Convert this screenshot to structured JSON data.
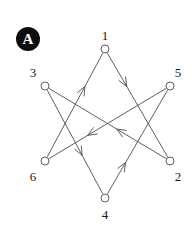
{
  "figure": {
    "panel_label": "A",
    "background_color": "#ffffff",
    "stroke_color": "#4d4d4d",
    "badge_color": "#0d0d0d",
    "badge_text_color": "#ffffff",
    "width": 192,
    "height": 226
  },
  "diagram_data": {
    "type": "directed-graph",
    "layout": "hexagram",
    "nodes": [
      {
        "id": "1",
        "label": "1",
        "cx": 105,
        "cy": 49,
        "r": 4,
        "label_x": 105,
        "label_y": 29
      },
      {
        "id": "3",
        "label": "3",
        "cx": 45,
        "cy": 86,
        "r": 4,
        "label_x": 33,
        "label_y": 66
      },
      {
        "id": "5",
        "label": "5",
        "cx": 170,
        "cy": 86,
        "r": 4,
        "label_x": 178,
        "label_y": 66
      },
      {
        "id": "6",
        "label": "6",
        "cx": 45,
        "cy": 161,
        "r": 4,
        "label_x": 33,
        "label_y": 170
      },
      {
        "id": "2",
        "label": "2",
        "cx": 170,
        "cy": 161,
        "r": 4,
        "label_x": 178,
        "label_y": 170
      },
      {
        "id": "4",
        "label": "4",
        "cx": 105,
        "cy": 198,
        "r": 4,
        "label_x": 105,
        "label_y": 208
      }
    ],
    "edges": [
      {
        "from": "1",
        "to": "2",
        "arrow_at": 0.32,
        "arrow_dir": "down-right"
      },
      {
        "from": "2",
        "to": "3",
        "arrow_at": 0.42,
        "arrow_dir": "left"
      },
      {
        "from": "3",
        "to": "4",
        "arrow_at": 0.63,
        "arrow_dir": "down"
      },
      {
        "from": "4",
        "to": "5",
        "arrow_at": 0.3,
        "arrow_dir": "up-right"
      },
      {
        "from": "5",
        "to": "6",
        "arrow_at": 0.67,
        "arrow_dir": "down-left"
      },
      {
        "from": "6",
        "to": "1",
        "arrow_at": 0.68,
        "arrow_dir": "up-right"
      }
    ],
    "edge_list_text": "1->2, 2->3, 3->4, 4->5, 5->6, 6->1",
    "triangle_1": [
      "1",
      "2",
      "6"
    ],
    "triangle_2": [
      "3",
      "4",
      "5"
    ],
    "node_count": 6,
    "edge_count": 6
  }
}
